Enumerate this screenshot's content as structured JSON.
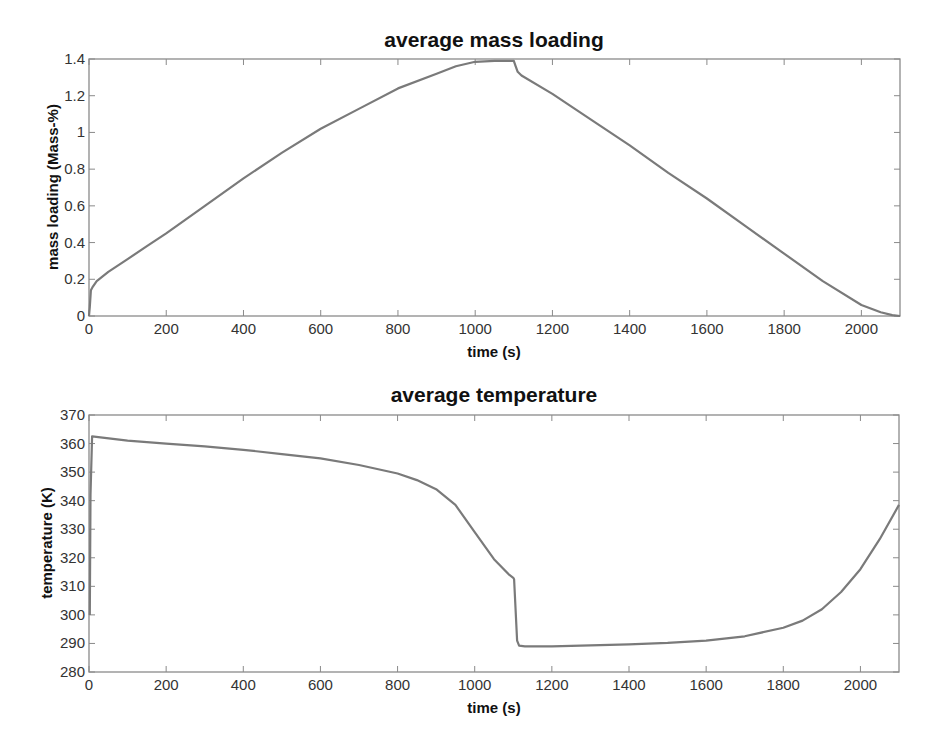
{
  "chart_data": [
    {
      "type": "line",
      "title": "average mass loading",
      "xlabel": "time (s)",
      "ylabel": "mass loading (Mass-%)",
      "xlim": [
        0,
        2100
      ],
      "ylim": [
        0,
        1.4
      ],
      "xticks": [
        0,
        200,
        400,
        600,
        800,
        1000,
        1200,
        1400,
        1600,
        1800,
        2000
      ],
      "yticks": [
        0,
        0.2,
        0.4,
        0.6,
        0.8,
        1,
        1.2,
        1.4
      ],
      "xtick_labels": [
        "0",
        "200",
        "400",
        "600",
        "800",
        "1000",
        "1200",
        "1400",
        "1600",
        "1800",
        "2000"
      ],
      "ytick_labels": [
        "0",
        "0.2",
        "0.4",
        "0.6",
        "0.8",
        "1",
        "1.2",
        "1.4"
      ],
      "grid": false,
      "series": [
        {
          "name": "mass loading",
          "color": "#7a7a7a",
          "x": [
            0,
            2,
            5,
            10,
            20,
            50,
            100,
            150,
            200,
            300,
            400,
            500,
            600,
            700,
            800,
            900,
            950,
            1000,
            1050,
            1100,
            1105,
            1110,
            1120,
            1200,
            1300,
            1400,
            1500,
            1600,
            1700,
            1800,
            1900,
            2000,
            2050,
            2080,
            2100
          ],
          "y": [
            0,
            0.05,
            0.14,
            0.16,
            0.19,
            0.24,
            0.31,
            0.38,
            0.45,
            0.6,
            0.75,
            0.89,
            1.02,
            1.13,
            1.24,
            1.32,
            1.36,
            1.385,
            1.39,
            1.39,
            1.36,
            1.33,
            1.31,
            1.21,
            1.07,
            0.93,
            0.78,
            0.64,
            0.49,
            0.34,
            0.19,
            0.06,
            0.02,
            0.005,
            0
          ]
        }
      ]
    },
    {
      "type": "line",
      "title": "average temperature",
      "xlabel": "time (s)",
      "ylabel": "temperature (K)",
      "xlim": [
        0,
        2100
      ],
      "ylim": [
        280,
        370
      ],
      "xticks": [
        0,
        200,
        400,
        600,
        800,
        1000,
        1200,
        1400,
        1600,
        1800,
        2000
      ],
      "yticks": [
        280,
        290,
        300,
        310,
        320,
        330,
        340,
        350,
        360,
        370
      ],
      "xtick_labels": [
        "0",
        "200",
        "400",
        "600",
        "800",
        "1000",
        "1200",
        "1400",
        "1600",
        "1800",
        "2000"
      ],
      "ytick_labels": [
        "280",
        "290",
        "300",
        "310",
        "320",
        "330",
        "340",
        "350",
        "360",
        "370"
      ],
      "grid": false,
      "series": [
        {
          "name": "temperature",
          "color": "#7a7a7a",
          "x": [
            2,
            4,
            8,
            100,
            200,
            300,
            400,
            500,
            600,
            700,
            800,
            850,
            900,
            950,
            1000,
            1050,
            1090,
            1100,
            1102,
            1110,
            1115,
            1130,
            1200,
            1300,
            1400,
            1500,
            1600,
            1700,
            1800,
            1850,
            1900,
            1950,
            2000,
            2050,
            2100
          ],
          "y": [
            300,
            342,
            362.5,
            361,
            360,
            359,
            357.8,
            356.3,
            354.8,
            352.5,
            349.5,
            347.2,
            344,
            338.5,
            329,
            319.5,
            314,
            313,
            312.5,
            291,
            289.2,
            289,
            289,
            289.3,
            289.7,
            290.2,
            291,
            292.5,
            295.5,
            298,
            302,
            308,
            316,
            326.5,
            338.5
          ]
        }
      ]
    }
  ]
}
